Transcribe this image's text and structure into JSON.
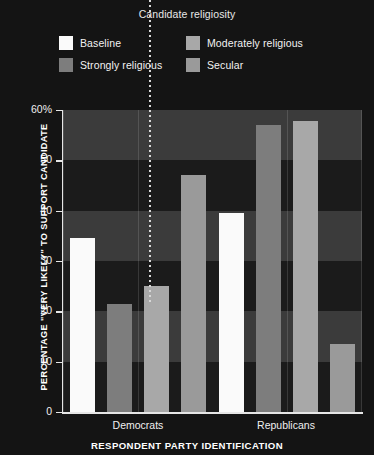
{
  "legend": {
    "title": "Candidate religiosity",
    "items": [
      {
        "label": "Baseline",
        "color": "#fafafa"
      },
      {
        "label": "Moderately religious",
        "color": "#a8a8a8"
      },
      {
        "label": "Strongly religious",
        "color": "#7d7d7d"
      },
      {
        "label": "Secular",
        "color": "#9a9a9a"
      }
    ]
  },
  "axes": {
    "y_title": "PERCENTAGE \"VERY LIKELY\" TO SUPPORT CANDIDATE",
    "x_title": "RESPONDENT PARTY IDENTIFICATION",
    "y_ticks": [
      "60%",
      "50",
      "40",
      "30",
      "20",
      "10",
      "0"
    ]
  },
  "chart_data": {
    "type": "bar",
    "title": "Candidate religiosity",
    "xlabel": "RESPONDENT PARTY IDENTIFICATION",
    "ylabel": "PERCENTAGE \"VERY LIKELY\" TO SUPPORT CANDIDATE",
    "ylim": [
      0,
      60
    ],
    "yticks": [
      0,
      10,
      20,
      30,
      40,
      50,
      60
    ],
    "grid": "horizontal-bands",
    "legend_position": "top",
    "categories": [
      "Democrats",
      "Republicans"
    ],
    "series": [
      {
        "name": "Baseline",
        "color": "#fafafa",
        "values": [
          34.5,
          39.5
        ]
      },
      {
        "name": "Strongly religious",
        "color": "#7d7d7d",
        "values": [
          21.5,
          57.0
        ]
      },
      {
        "name": "Moderately religious",
        "color": "#a8a8a8",
        "values": [
          25.0,
          57.8
        ]
      },
      {
        "name": "Secular",
        "color": "#9a9a9a",
        "values": [
          47.0,
          13.5
        ]
      }
    ]
  },
  "style": {
    "background": "#141414",
    "band_light": "#3b3b3b",
    "band_dark": "#1b1b1b",
    "axis_color": "#e6e6e6"
  }
}
